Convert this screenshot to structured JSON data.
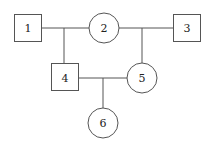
{
  "diagram": {
    "type": "pedigree",
    "line_color": "#555555",
    "nodes": [
      {
        "id": "1",
        "label": "1",
        "shape": "square"
      },
      {
        "id": "2",
        "label": "2",
        "shape": "circle"
      },
      {
        "id": "3",
        "label": "3",
        "shape": "square"
      },
      {
        "id": "4",
        "label": "4",
        "shape": "square"
      },
      {
        "id": "5",
        "label": "5",
        "shape": "circle"
      },
      {
        "id": "6",
        "label": "6",
        "shape": "circle"
      }
    ],
    "edges": [
      {
        "from": "1",
        "to": "2",
        "type": "mating"
      },
      {
        "from": "2",
        "to": "3",
        "type": "mating"
      },
      {
        "from": "1-2",
        "to": "4",
        "type": "descent"
      },
      {
        "from": "2-3",
        "to": "5",
        "type": "descent"
      },
      {
        "from": "4",
        "to": "5",
        "type": "mating"
      },
      {
        "from": "4-5",
        "to": "6",
        "type": "descent"
      }
    ]
  }
}
